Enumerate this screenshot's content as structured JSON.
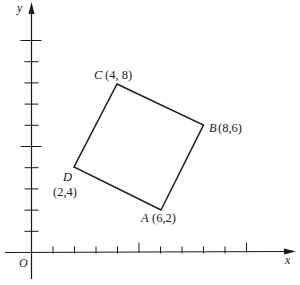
{
  "figure": {
    "axes": {
      "x_label": "x",
      "y_label": "y",
      "origin_label": "O",
      "x_ticks": [
        1,
        2,
        3,
        4,
        5,
        6,
        7,
        8,
        9,
        10
      ],
      "y_ticks": [
        1,
        2,
        3,
        4,
        5,
        6,
        7,
        8,
        9,
        10
      ],
      "long_tick_every": 5
    },
    "quadrilateral": {
      "vertices": [
        {
          "name": "A",
          "coords": "(6,2)",
          "x": 6,
          "y": 2
        },
        {
          "name": "B",
          "coords": "(8,6)",
          "x": 8,
          "y": 6
        },
        {
          "name": "C",
          "coords": "(4, 8)",
          "x": 4,
          "y": 8
        },
        {
          "name": "D",
          "coords": "(2,4)",
          "x": 2,
          "y": 4
        }
      ]
    },
    "colors": {
      "ink": "#1a1a1a",
      "background": "#ffffff"
    }
  }
}
